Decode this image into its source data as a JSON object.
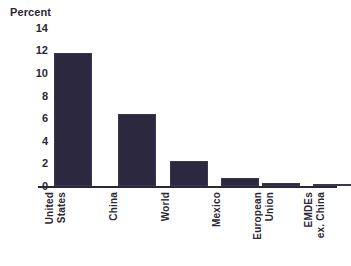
{
  "chart_data": {
    "type": "bar",
    "title": "",
    "subtitle": "",
    "xlabel": "",
    "ylabel": "Percent",
    "ylim": [
      0,
      14
    ],
    "yticks": [
      "14",
      "12",
      "10",
      "8",
      "6",
      "4",
      "2",
      "0"
    ],
    "grid": false,
    "legend": null,
    "bar_color": "#2b2840",
    "text_color": "#2b2736",
    "background": "#ffffff",
    "categories": [
      "United States",
      "China",
      "World",
      "Mexico",
      "European Union",
      "EMDEs ex. China"
    ],
    "category_lines": [
      [
        "United",
        "States"
      ],
      [
        "China"
      ],
      [
        "World"
      ],
      [
        "Mexico"
      ],
      [
        "European",
        "Union"
      ],
      [
        "EMDEs",
        "ex. China"
      ]
    ],
    "values": [
      11.8,
      6.4,
      2.2,
      0.7,
      0.25,
      0.1
    ]
  },
  "axis": {
    "percent_title": "Percent",
    "tick_14": "14",
    "tick_12": "12",
    "tick_10": "10",
    "tick_8": "8",
    "tick_6": "6",
    "tick_4": "4",
    "tick_2": "2",
    "tick_0": "0"
  },
  "labels": {
    "us_line1": "United",
    "us_line2": "States",
    "china_line1": "China",
    "world_line1": "World",
    "mexico_line1": "Mexico",
    "eu_line1": "European",
    "eu_line2": "Union",
    "emde_line1": "EMDEs",
    "emde_line2": "ex. China"
  }
}
